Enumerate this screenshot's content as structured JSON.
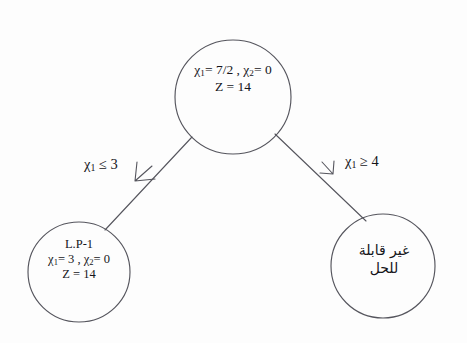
{
  "diagram": {
    "type": "branch-and-bound-tree",
    "title": "",
    "background_color": "#fdfdfd",
    "stroke_color": "#4a4a52",
    "text_color": "#15151a"
  },
  "nodes": [
    {
      "id": "root",
      "name": "root-node",
      "cx": 233,
      "cy": 97,
      "r": 58,
      "lines": [
        "χ₁= 7/2 , χ₂= 0",
        "Z = 14"
      ],
      "line1_pre": "χ",
      "line1_sub1": "1",
      "line1_mid": "= 7/2 , ",
      "line1_sub2": "2",
      "line1_post": "= 0",
      "line2": "Z = 14"
    },
    {
      "id": "left",
      "name": "left-child-node",
      "cx": 79,
      "cy": 272,
      "r": 51,
      "label": "L.P-1",
      "line1_pre": "χ",
      "line1_sub1": "1",
      "line1_mid": "= 3 , ",
      "line1_sub2": "2",
      "line1_post": "= 0",
      "line2": "Z = 14"
    },
    {
      "id": "right",
      "name": "right-child-node",
      "cx": 383,
      "cy": 266,
      "r": 52,
      "line1": "غير قابلة",
      "line2": "للحل"
    }
  ],
  "edges": [
    {
      "id": "edge-left",
      "name": "edge-root-to-left",
      "label_chi": "χ",
      "label_sub": "1",
      "label_rest": " ≤ 3",
      "from": "root",
      "to": "left"
    },
    {
      "id": "edge-right",
      "name": "edge-root-to-right",
      "label_chi": "χ",
      "label_sub": "1",
      "label_rest": " ≥ 4",
      "from": "root",
      "to": "right"
    }
  ]
}
